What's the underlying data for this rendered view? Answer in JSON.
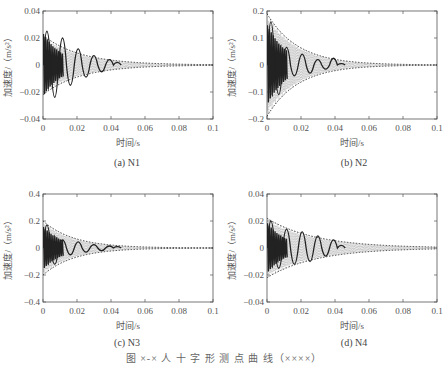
{
  "figure_caption": "图 ×-× 人 十 字 形 测 点 曲 线（××××）",
  "chart_data": [
    {
      "id": "a",
      "type": "line",
      "caption": "(a) N1",
      "xlabel": "时间/s",
      "ylabel": "加速度/（m/s²）",
      "xlim": [
        0,
        0.1
      ],
      "ylim": [
        -0.04,
        0.04
      ],
      "xticks": [
        "0",
        "0.02",
        "0.04",
        "0.06",
        "0.08",
        "0.1"
      ],
      "yticks": [
        "-0.04",
        "-0.02",
        "0",
        "0.02",
        "0.04"
      ],
      "grid": false,
      "envelope_amplitude": 0.022,
      "envelope_decay": 45,
      "measured_end_time": 0.046,
      "measured_peaks": [
        0.025,
        -0.024,
        0.02,
        -0.015,
        0.012,
        -0.009,
        0.007,
        -0.005,
        0.004,
        0.002
      ],
      "series": [
        {
          "name": "理论包络",
          "style": "dotted"
        },
        {
          "name": "实测加速度",
          "style": "solid"
        }
      ]
    },
    {
      "id": "b",
      "type": "line",
      "caption": "(b) N2",
      "xlabel": "时间/s",
      "ylabel": "加速度/（m/s²）",
      "xlim": [
        0,
        0.1
      ],
      "ylim": [
        -0.2,
        0.2
      ],
      "xticks": [
        "0",
        "0.02",
        "0.04",
        "0.06",
        "0.08",
        "0.1"
      ],
      "yticks": [
        "-0.2",
        "-0.1",
        "0",
        "0.1",
        "0.2"
      ],
      "grid": false,
      "envelope_amplitude": 0.19,
      "envelope_decay": 55,
      "measured_end_time": 0.046,
      "measured_peaks": [
        0.16,
        -0.11,
        0.065,
        -0.04,
        0.04,
        -0.03,
        0.02,
        -0.015,
        0.025,
        0.005
      ],
      "series": [
        {
          "name": "理论包络",
          "style": "dotted"
        },
        {
          "name": "实测加速度",
          "style": "solid"
        }
      ]
    },
    {
      "id": "c",
      "type": "line",
      "caption": "(c) N3",
      "xlabel": "时间/s",
      "ylabel": "加速度/（m/s²）",
      "xlim": [
        0,
        0.1
      ],
      "ylim": [
        -0.4,
        0.4
      ],
      "xticks": [
        "0",
        "0.02",
        "0.04",
        "0.06",
        "0.08",
        "0.1"
      ],
      "yticks": [
        "-0.4",
        "-0.2",
        "0",
        "0.2",
        "0.4"
      ],
      "grid": false,
      "envelope_amplitude": 0.2,
      "envelope_decay": 55,
      "measured_end_time": 0.046,
      "measured_peaks": [
        0.17,
        -0.12,
        0.06,
        -0.05,
        0.045,
        -0.03,
        0.025,
        -0.02,
        0.015,
        0.01
      ],
      "series": [
        {
          "name": "理论包络",
          "style": "dotted"
        },
        {
          "name": "实测加速度",
          "style": "solid"
        }
      ]
    },
    {
      "id": "d",
      "type": "line",
      "caption": "(d) N4",
      "xlabel": "时间/s",
      "ylabel": "加速度/（m/s²）",
      "xlim": [
        0,
        0.1
      ],
      "ylim": [
        -0.04,
        0.04
      ],
      "xticks": [
        "0",
        "0.02",
        "0.04",
        "0.06",
        "0.08",
        "0.1"
      ],
      "yticks": [
        "-0.04",
        "-0.02",
        "0",
        "0.02",
        "0.04"
      ],
      "grid": false,
      "envelope_amplitude": 0.022,
      "envelope_decay": 35,
      "measured_end_time": 0.046,
      "measured_peaks": [
        0.02,
        -0.015,
        0.014,
        -0.012,
        0.012,
        -0.01,
        0.009,
        -0.006,
        0.006,
        0.002
      ],
      "series": [
        {
          "name": "理论包络",
          "style": "dotted"
        },
        {
          "name": "实测加速度",
          "style": "solid"
        }
      ]
    }
  ]
}
